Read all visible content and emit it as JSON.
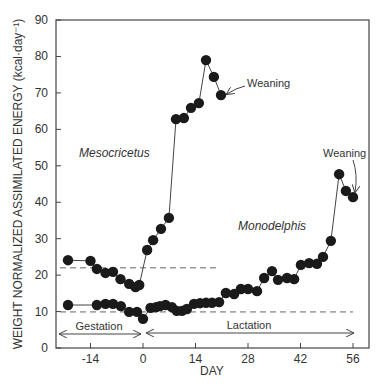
{
  "chart_data": {
    "type": "line",
    "title": "",
    "xlabel": "DAY",
    "ylabel": "WEIGHT NORMALIZED ASSIMILATED ENERGY (kcal·day⁻¹)",
    "xlim": [
      -23,
      60
    ],
    "ylim": [
      0,
      90
    ],
    "x_ticks": [
      -14,
      0,
      14,
      28,
      42,
      56
    ],
    "x_tick_labels": [
      "-14",
      "0",
      "14",
      "28",
      "42",
      "56"
    ],
    "y_ticks": [
      0,
      10,
      20,
      30,
      40,
      50,
      60,
      70,
      80,
      90
    ],
    "y_tick_labels": [
      "0",
      "10",
      "20",
      "30",
      "40",
      "50",
      "60",
      "70",
      "80",
      "90"
    ],
    "grid": false,
    "legend": null,
    "series": [
      {
        "name": "Mesocricetus",
        "label_pos": {
          "day": -17,
          "value": 53
        },
        "x": [
          -20,
          -14,
          -12.3,
          -10,
          -8,
          -6,
          -3.7,
          -2,
          -1,
          1.1,
          2.7,
          4.8,
          6.9,
          8.8,
          10.9,
          12.8,
          14.9,
          16.8,
          18.9,
          20.8
        ],
        "values": [
          24.1,
          23.9,
          21.7,
          20.6,
          20.9,
          18.9,
          17.6,
          16.7,
          17.3,
          26.9,
          29.6,
          32.7,
          35.7,
          62.8,
          63.1,
          65.9,
          67.2,
          79.0,
          74.4,
          69.4
        ]
      },
      {
        "name": "Monodelphis",
        "label_pos": {
          "day": 25,
          "value": 33
        },
        "x": [
          -20,
          -12.3,
          -10,
          -8,
          -5.9,
          -3.7,
          -1.6,
          0,
          2,
          3.5,
          4.5,
          6,
          7.7,
          9,
          10.4,
          11.7,
          13.6,
          15.2,
          16.8,
          18.4,
          20.3,
          22.1,
          24.3,
          26.1,
          28,
          30.4,
          32.3,
          34.4,
          36,
          38.4,
          40.3,
          42.1,
          44.3,
          46.4,
          48,
          50.1,
          52.3,
          54.1,
          56
        ],
        "values": [
          11.8,
          11.8,
          12.1,
          12.1,
          11.5,
          9.9,
          9.9,
          8.0,
          11.0,
          11.2,
          11.5,
          11.8,
          11.2,
          10.2,
          10.2,
          10.7,
          12.1,
          12.3,
          12.4,
          12.4,
          12.6,
          15.1,
          14.8,
          16.2,
          16.2,
          15.6,
          19.2,
          21.1,
          18.7,
          19.2,
          18.9,
          22.8,
          23.3,
          23.1,
          25.0,
          29.4,
          47.7,
          43.1,
          41.4
        ]
      }
    ],
    "reference_lines": [
      {
        "name": "Mesocricetus baseline",
        "style": "dashed",
        "value": 22,
        "x_from": -20,
        "x_to": 20.5
      },
      {
        "name": "Monodelphis baseline",
        "style": "dashed",
        "value": 9.9,
        "x_from": -20,
        "x_to": 56
      }
    ],
    "annotations": [
      {
        "text": "Weaning",
        "series": "Mesocricetus",
        "day": 20.8,
        "value": 69.4
      },
      {
        "text": "Weaning",
        "series": "Monodelphis",
        "day": 56,
        "value": 41.4
      },
      {
        "text": "Gestation",
        "range": [
          -23,
          0
        ]
      },
      {
        "text": "Lactation",
        "range": [
          0,
          56
        ]
      }
    ]
  },
  "labels": {
    "xlabel": "DAY",
    "ylabel": "WEIGHT NORMALIZED ASSIMILATED ENERGY (kcal·day⁻¹)",
    "series1": "Mesocricetus",
    "series2": "Monodelphis",
    "weaning1": "Weaning",
    "weaning2": "Weaning",
    "gestation": "Gestation",
    "lactation": "Lactation"
  }
}
